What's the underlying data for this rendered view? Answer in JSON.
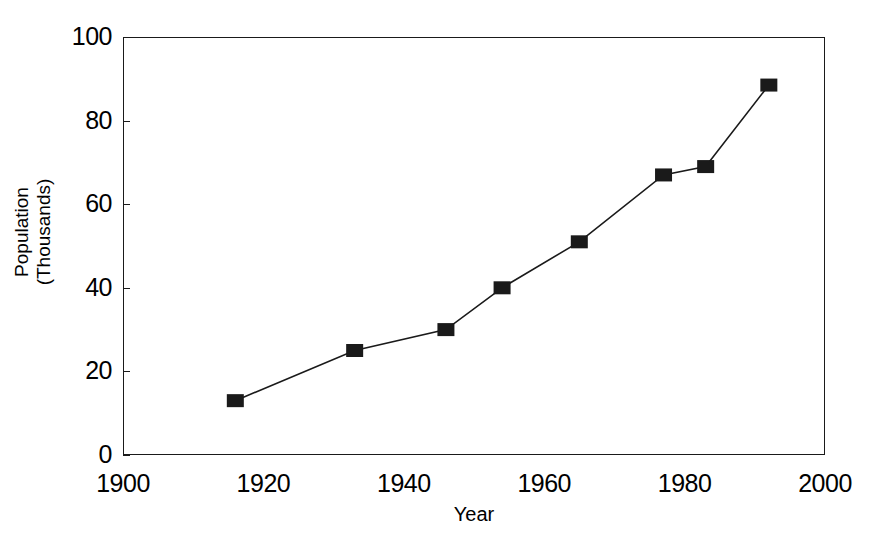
{
  "chart_data": {
    "type": "line",
    "title": "",
    "subtitle": "",
    "xlabel": "Year",
    "ylabel": "Population\n(Thousands)",
    "ylabel_lines": [
      "Population",
      "(Thousands)"
    ],
    "xlim": [
      1900,
      2000
    ],
    "ylim": [
      0,
      100
    ],
    "xticks": [
      1900,
      1920,
      1940,
      1960,
      1980,
      2000
    ],
    "yticks": [
      0,
      20,
      40,
      60,
      80,
      100
    ],
    "xtick_labels": [
      "1900",
      "1920",
      "1940",
      "1960",
      "1980",
      "2000"
    ],
    "ytick_labels": [
      "0",
      "20",
      "40",
      "60",
      "80",
      "100"
    ],
    "grid": false,
    "legend": null,
    "legend_position": "none",
    "marker": "square",
    "marker_color": "#1a1a1a",
    "line_color": "#1a1a1a",
    "background_color": "#ffffff",
    "series": [
      {
        "name": "Population",
        "x": [
          1916,
          1933,
          1946,
          1954,
          1965,
          1977,
          1983,
          1992
        ],
        "values": [
          13,
          25,
          30,
          40,
          51,
          67,
          69,
          88.5
        ],
        "points": [
          {
            "x": 1916,
            "y": 13
          },
          {
            "x": 1933,
            "y": 25
          },
          {
            "x": 1946,
            "y": 30
          },
          {
            "x": 1954,
            "y": 40
          },
          {
            "x": 1965,
            "y": 51
          },
          {
            "x": 1977,
            "y": 67
          },
          {
            "x": 1983,
            "y": 69
          },
          {
            "x": 1992,
            "y": 88.5
          }
        ]
      }
    ]
  }
}
